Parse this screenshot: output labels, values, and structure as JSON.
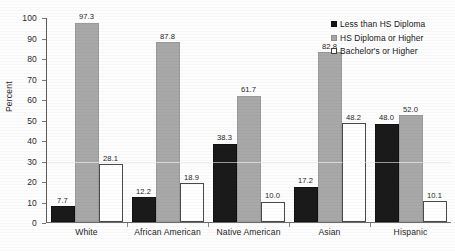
{
  "chart_data": {
    "type": "bar",
    "title": "",
    "xlabel": "",
    "ylabel": "Percent",
    "ylim": [
      0,
      100
    ],
    "ytick_step": 10,
    "yticks": [
      0,
      10,
      20,
      30,
      40,
      50,
      60,
      70,
      80,
      90,
      100
    ],
    "grid": "faint horizontal gridline at 30",
    "gridlines_at": [
      30
    ],
    "legend_position": "top-right",
    "categories": [
      "White",
      "African American",
      "Native American",
      "Asian",
      "Hispanic"
    ],
    "series": [
      {
        "name": "Less than HS Diploma",
        "color": "#1a1a1a",
        "values": [
          7.7,
          12.2,
          38.3,
          17.2,
          48.0
        ],
        "labels": [
          "7.7",
          "12.2",
          "38.3",
          "17.2",
          "48.0"
        ]
      },
      {
        "name": "HS Diploma or Higher",
        "color": "#a8a8a8",
        "values": [
          97.3,
          87.8,
          61.7,
          82.8,
          52.0
        ],
        "labels": [
          "97.3",
          "87.8",
          "61.7",
          "82.8",
          "52.0"
        ]
      },
      {
        "name": "Bachelor's or Higher",
        "color": "#ffffff",
        "values": [
          28.1,
          18.9,
          10.0,
          48.2,
          10.1
        ],
        "labels": [
          "28.1",
          "18.9",
          "10.0",
          "48.2",
          "10.1"
        ]
      }
    ]
  },
  "axis": {
    "y_title": "Percent"
  },
  "legend": {
    "items": [
      {
        "label": "Less than HS Diploma"
      },
      {
        "label": "HS Diploma or Higher"
      },
      {
        "label": "Bachelor's or Higher"
      }
    ]
  }
}
